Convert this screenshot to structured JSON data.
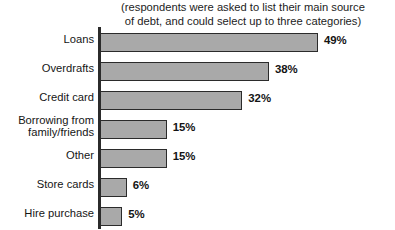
{
  "chart_data": {
    "type": "bar",
    "orientation": "horizontal",
    "title": "",
    "subtitle": "(respondents were asked to list their main source\nof debt, and could select up to three categories)",
    "xlabel": "",
    "ylabel": "",
    "xlim": [
      0,
      56
    ],
    "grid": false,
    "legend": null,
    "value_suffix": "%",
    "categories": [
      "Loans",
      "Overdrafts",
      "Credit card",
      "Borrowing from\nfamily/friends",
      "Other",
      "Store cards",
      "Hire purchase"
    ],
    "values": [
      49,
      38,
      32,
      15,
      15,
      6,
      5
    ],
    "data_labels": [
      "49%",
      "38%",
      "32%",
      "15%",
      "15%",
      "6%",
      "5%"
    ],
    "colors": {
      "bar_fill": "#a9a9a9",
      "bar_border": "#2b2b2b",
      "axis": "#2b2b2b",
      "text": "#151515",
      "background": "#ffffff"
    }
  }
}
